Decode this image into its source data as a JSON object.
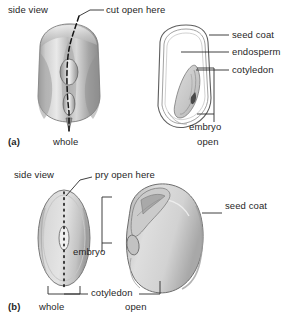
{
  "figure": {
    "panels": [
      {
        "id": "a",
        "marker": "(a)",
        "subject": "corn-kernel",
        "top_labels": [
          {
            "name": "side-view",
            "text": "side view"
          },
          {
            "name": "cut-open-here",
            "text": "cut open here"
          }
        ],
        "callouts": [
          {
            "name": "seed-coat",
            "text": "seed coat"
          },
          {
            "name": "endosperm",
            "text": "endosperm"
          },
          {
            "name": "cotyledon",
            "text": "cotyledon"
          },
          {
            "name": "embryo",
            "text": "embryo"
          }
        ],
        "captions": [
          {
            "name": "whole",
            "text": "whole"
          },
          {
            "name": "open",
            "text": "open"
          }
        ]
      },
      {
        "id": "b",
        "marker": "(b)",
        "subject": "bean-seed",
        "top_labels": [
          {
            "name": "side-view",
            "text": "side view"
          },
          {
            "name": "pry-open-here",
            "text": "pry open here"
          }
        ],
        "callouts": [
          {
            "name": "seed-coat",
            "text": "seed coat"
          },
          {
            "name": "embryo",
            "text": "embryo"
          },
          {
            "name": "cotyledon",
            "text": "cotyledon"
          }
        ],
        "captions": [
          {
            "name": "whole",
            "text": "whole"
          },
          {
            "name": "open",
            "text": "open"
          }
        ]
      }
    ],
    "colors": {
      "background": "#ffffff",
      "text": "#1f1f1f",
      "leader_line": "#2b2b2b",
      "outline": "#555555",
      "kernel_dark": "#8e8e8e",
      "kernel_mid": "#bdbdbd",
      "kernel_light": "#e6e6e6",
      "endosperm_fill": "#ffffff",
      "embryo_fill": "#cfcfcf",
      "bean_fill": "#d5d5d5",
      "bean_shadow": "#a9a9a9"
    }
  }
}
